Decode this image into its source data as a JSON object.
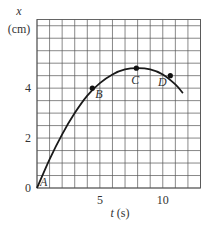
{
  "chart_data": {
    "type": "line",
    "title": "",
    "xlabel_var": "t",
    "xlabel_unit": "(s)",
    "ylabel_var": "x",
    "ylabel_unit": "(cm)",
    "xlim": [
      0,
      13
    ],
    "ylim": [
      0,
      6.75
    ],
    "x_ticks": [
      5,
      10
    ],
    "y_ticks": [
      0,
      2,
      4
    ],
    "x_tick_labels": [
      "5",
      "10"
    ],
    "y_tick_labels": [
      "0",
      "2",
      "4"
    ],
    "grid": true,
    "grid_step_x": 1,
    "grid_step_y": 0.5,
    "series": [
      {
        "name": "x(t)",
        "x": [
          0,
          1,
          2,
          3,
          4,
          5,
          6,
          7,
          8,
          9,
          10,
          11,
          11.6
        ],
        "y": [
          0,
          1.15,
          2.15,
          3.0,
          3.7,
          4.2,
          4.55,
          4.75,
          4.8,
          4.75,
          4.55,
          4.15,
          3.8
        ]
      }
    ],
    "points": [
      {
        "label": "A",
        "t": 0,
        "x": 0,
        "marker": false
      },
      {
        "label": "B",
        "t": 4.4,
        "x": 4.0,
        "marker": true
      },
      {
        "label": "C",
        "t": 7.9,
        "x": 4.8,
        "marker": true
      },
      {
        "label": "D",
        "t": 10.6,
        "x": 4.5,
        "marker": true
      }
    ]
  },
  "colors": {
    "grid": "#555555",
    "curve": "#1a1a1a",
    "text": "#333333"
  }
}
